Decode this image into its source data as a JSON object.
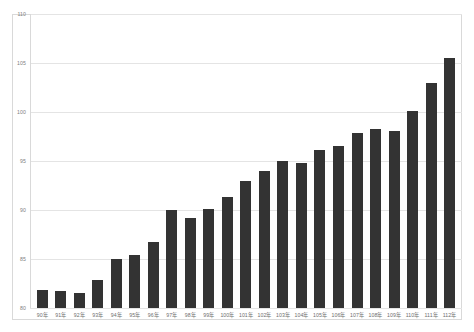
{
  "chart_data": {
    "type": "bar",
    "title": "",
    "subtitle": "",
    "xlabel": "",
    "ylabel": "",
    "ylim": [
      80,
      110
    ],
    "yticks": [
      80,
      85,
      90,
      95,
      100,
      105,
      110
    ],
    "ytick_labels": [
      "80",
      "85",
      "90",
      "95",
      "100",
      "105",
      "110"
    ],
    "grid": true,
    "legend": null,
    "legend_position": "none",
    "bar_color": "#333333",
    "grid_color": "#e4e4e4",
    "axis_color": "#d9d9d9",
    "tick_label_color": "#808080",
    "categories": [
      "90年",
      "91年",
      "92年",
      "93年",
      "94年",
      "95年",
      "96年",
      "97年",
      "98年",
      "99年",
      "100年",
      "101年",
      "102年",
      "103年",
      "104年",
      "105年",
      "106年",
      "107年",
      "108年",
      "109年",
      "110年",
      "111年",
      "112年"
    ],
    "values": [
      81.8,
      81.7,
      81.5,
      82.9,
      85.0,
      85.4,
      86.7,
      90.0,
      89.2,
      90.1,
      91.3,
      93.0,
      94.0,
      95.0,
      94.8,
      96.1,
      96.5,
      97.9,
      98.3,
      98.1,
      100.1,
      103.0,
      105.5
    ]
  }
}
